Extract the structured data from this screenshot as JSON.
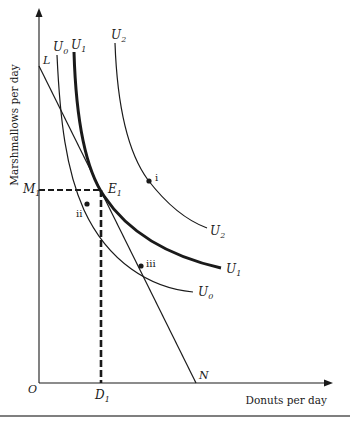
{
  "diagram": {
    "axes": {
      "x_label": "Donuts per day",
      "y_label": "Marshmallows per day",
      "origin_label": "O"
    },
    "budget_line": {
      "start_label": "L",
      "end_label": "N"
    },
    "indifference_curves": [
      {
        "id": "U0",
        "base": "U",
        "sub": "0",
        "emphasis": "normal"
      },
      {
        "id": "U1",
        "base": "U",
        "sub": "1",
        "emphasis": "bold"
      },
      {
        "id": "U2",
        "base": "U",
        "sub": "2",
        "emphasis": "normal"
      }
    ],
    "equilibrium": {
      "point_label_base": "E",
      "point_label_sub": "1",
      "y_marker_base": "M",
      "y_marker_sub": "1",
      "x_marker_base": "D",
      "x_marker_sub": "1"
    },
    "points": [
      {
        "label": "i",
        "on_curve": "U2"
      },
      {
        "label": "ii",
        "on_curve": "U0"
      },
      {
        "label": "iii",
        "on_curve": "U0"
      }
    ],
    "colors": {
      "ink": "#1a1a1a",
      "background": "#ffffff",
      "rule": "#555555"
    }
  }
}
